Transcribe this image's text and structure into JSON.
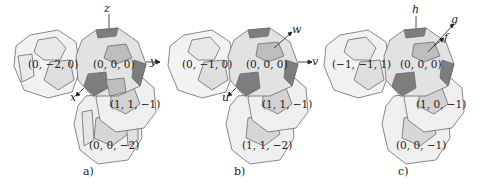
{
  "figure": {
    "panels": [
      {
        "id": "a",
        "caption": "a)",
        "center_label": "(0, 0, 0)",
        "left_label": "(0, −2, 0)",
        "right_label": "(1, 1, −1)",
        "bottom_label": "(0, 0, −2)",
        "axes": {
          "up": "z",
          "right": "y",
          "down_left": "x"
        }
      },
      {
        "id": "b",
        "caption": "b)",
        "center_label": "(0, 0, 0)",
        "left_label": "(0, −1, 0)",
        "right_label": "(1, 1, −1)",
        "bottom_label": "(1, 1, −2)",
        "axes": {
          "up_right": "w",
          "right": "v",
          "down_left": "u"
        }
      },
      {
        "id": "c",
        "caption": "c)",
        "center_label": "(0, 0, 0)",
        "left_label": "(−1, −1, 1)",
        "right_label": "(1, 0, −1)",
        "bottom_label": "(0, 0, −1)",
        "axes": {
          "up": "h",
          "up_right_far": "g",
          "up_right_near": "f"
        }
      }
    ],
    "colors": {
      "edge": "#6b6b6b",
      "face_light": "#f0f0f0",
      "face_mid": "#d9d9d9",
      "face_center": "#bdbdbd",
      "face_dark": "#7d7d7d",
      "face_highlight": "#a8a8a8"
    }
  }
}
